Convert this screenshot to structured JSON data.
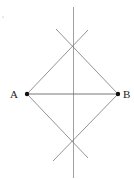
{
  "diagram": {
    "points": {
      "A": {
        "label": "A",
        "x": 27,
        "y": 94
      },
      "B": {
        "label": "B",
        "x": 118,
        "y": 94
      },
      "top": {
        "x": 73,
        "y": 46
      },
      "bottom": {
        "x": 73,
        "y": 141
      }
    },
    "line_color": "#777777",
    "point_color": "#111111"
  }
}
